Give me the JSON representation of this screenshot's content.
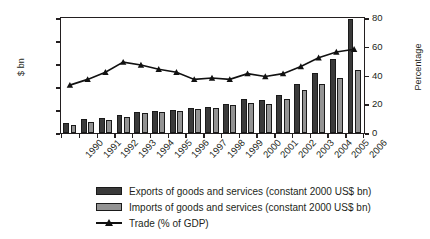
{
  "chart_data": {
    "type": "bar",
    "title": "",
    "xlabel": "",
    "ylabel": "$ bn",
    "y2label": "Percentage",
    "ylim": [
      0,
      1000
    ],
    "y2lim": [
      0,
      80
    ],
    "yticks": [
      0,
      200,
      400,
      600,
      800,
      1000
    ],
    "y2ticks": [
      0,
      20,
      40,
      60,
      80
    ],
    "grid": false,
    "legend_position": "bottom",
    "categories": [
      "1990",
      "1991",
      "1992",
      "1993",
      "1994",
      "1995",
      "1996",
      "1997",
      "1998",
      "1999",
      "2000",
      "2001",
      "2002",
      "2003",
      "2004",
      "2005",
      "2006"
    ],
    "series": [
      {
        "name": "Exports of goods and services (constant 2000 US$ bn)",
        "type": "bar",
        "axis": "left",
        "color": "#3a3a3a",
        "values": [
          90,
          120,
          130,
          155,
          185,
          195,
          200,
          220,
          230,
          250,
          295,
          285,
          330,
          430,
          520,
          640,
          990
        ]
      },
      {
        "name": "Imports of goods and services (constant 2000 US$ bn)",
        "type": "bar",
        "axis": "left",
        "color": "#939393",
        "values": [
          70,
          100,
          115,
          140,
          175,
          185,
          190,
          210,
          215,
          245,
          260,
          250,
          300,
          375,
          425,
          480,
          545
        ]
      },
      {
        "name": "Trade (% of GDP)",
        "type": "line",
        "axis": "right",
        "color": "#111111",
        "marker": "triangle",
        "values": [
          34,
          38,
          43,
          50,
          48,
          45,
          43,
          38,
          39,
          38,
          42,
          40,
          42,
          47,
          53,
          57,
          59
        ]
      }
    ]
  },
  "legend": {
    "items": [
      {
        "label": "Exports of goods and services (constant 2000 US$ bn)",
        "swatch": "dark-gray-square"
      },
      {
        "label": "Imports of goods and services (constant 2000 US$ bn)",
        "swatch": "light-gray-square"
      },
      {
        "label": "Trade (% of GDP)",
        "swatch": "black-line-triangle-marker"
      }
    ]
  }
}
